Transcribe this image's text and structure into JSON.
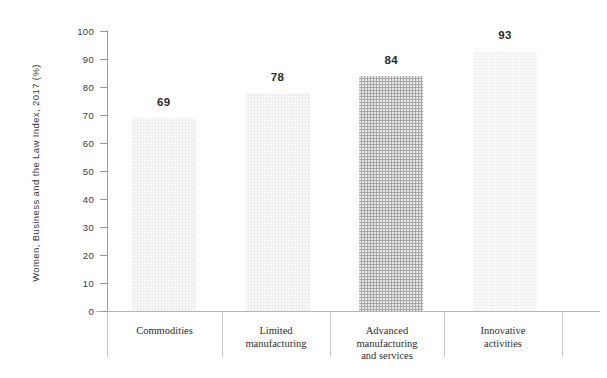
{
  "chart_data": {
    "type": "bar",
    "title": "",
    "subtitle": "",
    "xlabel": "",
    "ylabel": "Women, Business and the Law Index, 2017 (%)",
    "ylim": [
      0,
      100
    ],
    "ytick_values": [
      0,
      10,
      20,
      30,
      40,
      50,
      60,
      70,
      80,
      90,
      100
    ],
    "ytick_labels": [
      "0",
      "10",
      "20",
      "30",
      "40",
      "50",
      "60",
      "70",
      "80",
      "90",
      "100"
    ],
    "grid": false,
    "legend": "none",
    "categories": [
      "Commodities",
      "Limited manufacturing",
      "Advanced manufacturing and services",
      "Innovative activities"
    ],
    "category_label_lines": [
      [
        "Commodities"
      ],
      [
        "Limited",
        "manufacturing"
      ],
      [
        "Advanced",
        "manufacturing",
        "and services"
      ],
      [
        "Innovative",
        "activities"
      ]
    ],
    "values": [
      69,
      78,
      84,
      93
    ],
    "value_labels": [
      "69",
      "78",
      "84",
      "93"
    ],
    "bar_colors": [
      "#eceded",
      "#eceded",
      "#a6a8aa",
      "#f0f1f1"
    ],
    "highlight_index": 2,
    "colors": {
      "bar_default": "#eceded",
      "bar_highlight": "#a6a8aa",
      "axis": "#9a9a9a",
      "text": "#3a3a3a",
      "value_text": "#2b2b2b",
      "separator": "#c9c9c9",
      "background": "#ffffff"
    }
  }
}
